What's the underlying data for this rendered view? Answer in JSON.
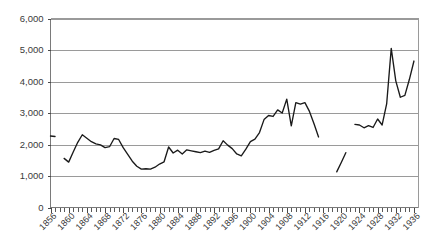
{
  "chart_data": {
    "type": "line",
    "title": "",
    "subtitle": "",
    "xlabel": "",
    "ylabel": "",
    "xlim": [
      1856,
      1937
    ],
    "ylim": [
      0,
      6000
    ],
    "grid": true,
    "legend_position": "none",
    "y_ticks": [
      0,
      1000,
      2000,
      3000,
      4000,
      5000,
      6000
    ],
    "y_tick_labels": [
      "0",
      "1,000",
      "2,000",
      "3,000",
      "4,000",
      "5,000",
      "6,000"
    ],
    "x_tick_labels": [
      "1856",
      "1860",
      "1864",
      "1868",
      "1872",
      "1876",
      "1880",
      "1884",
      "1888",
      "1892",
      "1896",
      "1900",
      "1904",
      "1908",
      "1912",
      "1916",
      "1920",
      "1924",
      "1928",
      "1932",
      "1936"
    ],
    "x_tick_label_step": 4,
    "x_minor_tick_step": 1,
    "series": [
      {
        "name": "series-1",
        "color": "#1a1a1a",
        "segments": [
          {
            "name": "segment-early",
            "x": [
              1856,
              1857
            ],
            "y": [
              2270,
              2255
            ]
          },
          {
            "name": "segment-main",
            "x": [
              1859,
              1860,
              1861,
              1862,
              1863,
              1864,
              1865,
              1866,
              1867,
              1868,
              1869,
              1870,
              1871,
              1872,
              1873,
              1874,
              1875,
              1876,
              1877,
              1878,
              1879,
              1880,
              1881,
              1882,
              1883,
              1884,
              1885,
              1886,
              1887,
              1888,
              1889,
              1890,
              1891,
              1892,
              1893,
              1894,
              1895,
              1896,
              1897,
              1898,
              1899,
              1900,
              1901,
              1902,
              1903,
              1904,
              1905,
              1906,
              1907,
              1908,
              1909,
              1910,
              1911,
              1912,
              1913,
              1914,
              1915
            ],
            "y": [
              1560,
              1440,
              1760,
              2070,
              2310,
              2200,
              2090,
              2020,
              1990,
              1900,
              1930,
              2190,
              2160,
              1900,
              1690,
              1470,
              1310,
              1220,
              1230,
              1220,
              1280,
              1380,
              1450,
              1920,
              1730,
              1820,
              1700,
              1830,
              1800,
              1770,
              1740,
              1790,
              1750,
              1810,
              1860,
              2120,
              1980,
              1870,
              1700,
              1640,
              1850,
              2090,
              2170,
              2380,
              2790,
              2920,
              2890,
              3100,
              3000,
              3440,
              2590,
              3330,
              3280,
              3330,
              3050,
              2660,
              2240
            ]
          },
          {
            "name": "segment-war-gap",
            "x": [
              1919,
              1920,
              1921
            ],
            "y": [
              1130,
              1430,
              1740
            ]
          },
          {
            "name": "segment-late",
            "x": [
              1923,
              1924,
              1925,
              1926,
              1927,
              1928,
              1929,
              1930,
              1931,
              1932,
              1933,
              1934,
              1935,
              1936
            ],
            "y": [
              2640,
              2620,
              2530,
              2600,
              2540,
              2810,
              2620,
              3300,
              5050,
              4020,
              3500,
              3560,
              4070,
              4650
            ]
          }
        ]
      }
    ]
  }
}
